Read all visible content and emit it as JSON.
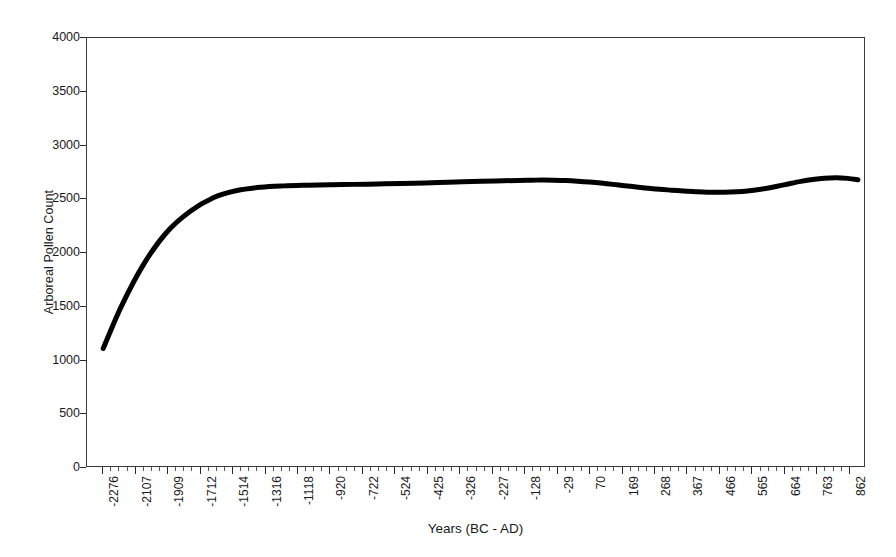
{
  "chart_data": {
    "type": "line",
    "title": "",
    "xlabel": "Years (BC - AD)",
    "ylabel": "Arboreal Pollen Count",
    "ylim": [
      0,
      4000
    ],
    "yticks": [
      0,
      500,
      1000,
      1500,
      2000,
      2500,
      3000,
      3500,
      4000
    ],
    "ytick_labels": [
      "0",
      "500",
      "1000",
      "1500",
      "2000",
      "2500",
      "3000",
      "3500",
      "4000"
    ],
    "grid": false,
    "legend": null,
    "legend_position": "none",
    "categories": [
      "-2276",
      "-2107",
      "-1909",
      "-1712",
      "-1514",
      "-1316",
      "-1118",
      "-920",
      "-722",
      "-524",
      "-425",
      "-326",
      "-227",
      "-128",
      "-29",
      "70",
      "169",
      "268",
      "367",
      "466",
      "565",
      "664",
      "763",
      "862"
    ],
    "xtick_labels": [
      "-2276",
      "-2107",
      "-1909",
      "-1712",
      "-1514",
      "-1316",
      "-1118",
      "-920",
      "-722",
      "-524",
      "-425",
      "-326",
      "-227",
      "-128",
      "-29",
      "70",
      "169",
      "268",
      "367",
      "466",
      "565",
      "664",
      "763",
      "862"
    ],
    "series": [
      {
        "name": "Arboreal Pollen Count",
        "color": "#000000",
        "line_width": 4,
        "x": [
          -2276,
          -2200,
          -2107,
          -2010,
          -1909,
          -1810,
          -1712,
          -1613,
          -1514,
          -1415,
          -1316,
          -1217,
          -1118,
          -1019,
          -920,
          -821,
          -722,
          -623,
          -524,
          -475,
          -425,
          -376,
          -326,
          -277,
          -227,
          -178,
          -128,
          -79,
          -29,
          20,
          70,
          120,
          169,
          219,
          268,
          318,
          367,
          417,
          466,
          516,
          565,
          615,
          664,
          714,
          763,
          813,
          862,
          905
        ],
        "values": [
          1098,
          1490,
          1880,
          2180,
          2380,
          2510,
          2575,
          2605,
          2618,
          2624,
          2628,
          2632,
          2636,
          2640,
          2645,
          2652,
          2658,
          2664,
          2669,
          2671,
          2672,
          2671,
          2668,
          2662,
          2654,
          2644,
          2632,
          2620,
          2608,
          2596,
          2586,
          2578,
          2570,
          2564,
          2559,
          2558,
          2560,
          2566,
          2578,
          2594,
          2614,
          2638,
          2660,
          2678,
          2690,
          2694,
          2688,
          2676
        ]
      }
    ],
    "annotations": []
  },
  "axes": {
    "y_title": "Arboreal Pollen Count",
    "x_title": "Years (BC - AD)"
  }
}
